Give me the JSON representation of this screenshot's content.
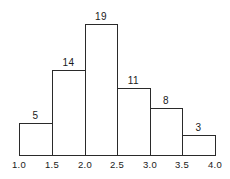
{
  "chart_data": {
    "type": "bar",
    "subtype": "histogram",
    "title": "",
    "xlabel": "",
    "ylabel": "",
    "bins": [
      {
        "from": 1.0,
        "to": 1.5,
        "count": 5
      },
      {
        "from": 1.5,
        "to": 2.0,
        "count": 14
      },
      {
        "from": 2.0,
        "to": 2.5,
        "count": 19
      },
      {
        "from": 2.5,
        "to": 3.0,
        "count": 11
      },
      {
        "from": 3.0,
        "to": 3.5,
        "count": 8
      },
      {
        "from": 3.5,
        "to": 4.0,
        "count": 3
      }
    ],
    "categories": [
      "1.0-1.5",
      "1.5-2.0",
      "2.0-2.5",
      "2.5-3.0",
      "3.0-3.5",
      "3.5-4.0"
    ],
    "values": [
      5,
      14,
      19,
      11,
      8,
      3
    ],
    "x_ticks": [
      "1.0",
      "1.5",
      "2.0",
      "2.5",
      "3.0",
      "3.5",
      "4.0"
    ],
    "xlim": [
      1.0,
      4.0
    ],
    "ylim": [
      0,
      19
    ],
    "grid": false,
    "legend": null,
    "data_labels": [
      "5",
      "14",
      "19",
      "11",
      "8",
      "3"
    ]
  },
  "layout": {
    "bar_edges_px": [
      19,
      52,
      85,
      117,
      150,
      182,
      215
    ],
    "baseline_y_px": 155,
    "bar_tops_px": [
      123,
      70,
      24,
      88,
      108,
      135
    ]
  }
}
